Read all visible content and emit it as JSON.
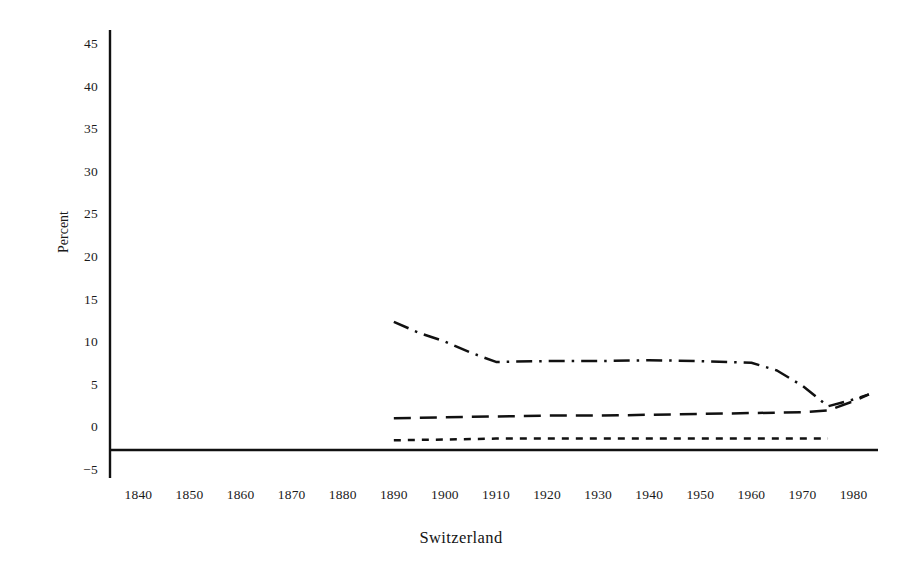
{
  "figure": {
    "caption": "Switzerland",
    "y_axis_title": "Percent"
  },
  "chart_data": {
    "type": "line",
    "title": "",
    "subtitle": "",
    "caption": "Switzerland",
    "xlabel": "",
    "ylabel": "Percent",
    "xlim": [
      1836,
      1984
    ],
    "ylim": [
      -5,
      45
    ],
    "grid": false,
    "legend": "none",
    "y_ticks": [
      -5,
      0,
      5,
      10,
      15,
      20,
      25,
      30,
      35,
      40,
      45
    ],
    "y_tick_labels": [
      "−5",
      "0",
      "5",
      "10",
      "15",
      "20",
      "25",
      "30",
      "35",
      "40",
      "45"
    ],
    "x_ticks": [
      1840,
      1850,
      1860,
      1870,
      1880,
      1890,
      1900,
      1910,
      1920,
      1930,
      1940,
      1950,
      1960,
      1970,
      1980
    ],
    "x_tick_labels": [
      "1840",
      "1850",
      "1860",
      "1870",
      "1880",
      "1890",
      "1900",
      "1910",
      "1920",
      "1930",
      "1940",
      "1950",
      "1960",
      "1970",
      "1980"
    ],
    "axis_baseline_value": -2.5,
    "series": [
      {
        "name": "series-dash-dot",
        "style": "dash-dot",
        "color": "#111111",
        "x": [
          1890,
          1895,
          1900,
          1905,
          1910,
          1920,
          1930,
          1940,
          1950,
          1960,
          1965,
          1970,
          1975,
          1980,
          1983
        ],
        "values": [
          12.5,
          11.2,
          10.2,
          8.9,
          7.8,
          7.9,
          7.9,
          8.0,
          7.9,
          7.7,
          6.8,
          5.0,
          2.6,
          3.4,
          4.0
        ]
      },
      {
        "name": "series-long-dash",
        "style": "long-dash",
        "color": "#111111",
        "x": [
          1890,
          1900,
          1910,
          1920,
          1930,
          1940,
          1950,
          1960,
          1970,
          1975,
          1980,
          1983
        ],
        "values": [
          1.2,
          1.3,
          1.4,
          1.5,
          1.5,
          1.6,
          1.7,
          1.8,
          1.9,
          2.1,
          3.2,
          4.0
        ]
      },
      {
        "name": "series-short-dash",
        "style": "short-dash",
        "color": "#111111",
        "x": [
          1890,
          1900,
          1910,
          1920,
          1930,
          1940,
          1950,
          1960,
          1970,
          1975
        ],
        "values": [
          -1.4,
          -1.3,
          -1.2,
          -1.2,
          -1.2,
          -1.2,
          -1.2,
          -1.2,
          -1.2,
          -1.2
        ]
      }
    ]
  }
}
